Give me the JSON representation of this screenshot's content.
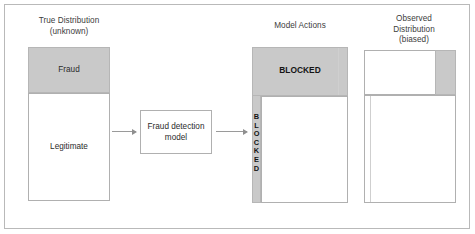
{
  "diagram": {
    "columns": [
      {
        "id": "true-distribution",
        "title": "True Distribution\n(unknown)",
        "segments": [
          {
            "label": "Fraud",
            "fill": "#c9c9c9"
          },
          {
            "label": "Legitimate",
            "fill": "#ffffff"
          }
        ]
      },
      {
        "id": "model-actions",
        "title": "Model Actions",
        "segments": [
          {
            "label": "BLOCKED",
            "fill": "#c9c9c9"
          },
          {
            "label": "BLOCKED",
            "fill": "#c9c9c9",
            "orientation": "vertical"
          }
        ]
      },
      {
        "id": "observed-distribution",
        "title": "Observed\nDistribution\n(biased)",
        "segments": [
          {
            "label": "",
            "fill": "#ffffff"
          },
          {
            "label": "",
            "fill": "#c9c9c9"
          }
        ]
      }
    ],
    "model": {
      "label": "Fraud detection\nmodel"
    },
    "labels": {
      "fraud": "Fraud",
      "legitimate": "Legitimate",
      "blocked_top": "BLOCKED",
      "blocked_vertical": "B\nL\nO\nC\nK\nE\nD",
      "title_true": "True Distribution\n(unknown)",
      "title_actions": "Model Actions",
      "title_observed": "Observed\nDistribution\n(biased)",
      "model_text": "Fraud detection\nmodel"
    },
    "colors": {
      "grey_fill": "#c9c9c9",
      "border": "#b0b0b0",
      "frame_border": "#b9b9b9",
      "arrow": "#9a9a9a",
      "text": "#2b2b2b"
    }
  }
}
